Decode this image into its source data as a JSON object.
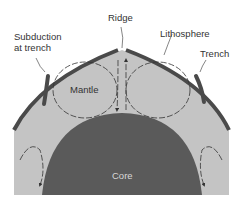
{
  "diagram": {
    "labels": {
      "ridge": "Ridge",
      "lithosphere": "Lithosphere",
      "subduction_line1": "Subduction",
      "subduction_line2": "at trench",
      "trench": "Trench",
      "mantle": "Mantle",
      "core": "Core"
    },
    "colors": {
      "mantle": "#c4c4c4",
      "lithosphere": "#4a4a4a",
      "core": "#5a5a5a",
      "arrows": "#333333",
      "text": "#333333",
      "core_text": "#d8d8d8"
    }
  }
}
